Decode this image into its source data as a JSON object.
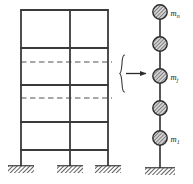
{
  "figure": {
    "width": 193,
    "height": 184,
    "background_color": "#ffffff",
    "line_color": "#3a3a3a",
    "dashed_line_color": "#8c8c8c",
    "mass_fill_color": "#b9b9b9",
    "mass_stroke_color": "#2b2b2b",
    "hatch_color": "#2b2b2b"
  },
  "frame": {
    "name": "multistory-building-frame",
    "bays": 2,
    "columns": [
      {
        "id": "column-left",
        "x": 21
      },
      {
        "id": "column-middle",
        "x": 70
      },
      {
        "id": "column-right",
        "x": 108
      }
    ],
    "column_top_y": 10,
    "column_base_y": 166,
    "beams_solid": [
      {
        "id": "beam-roof",
        "y": 10,
        "x1": 21,
        "x2": 108
      },
      {
        "id": "beam-level-5",
        "y": 48,
        "x1": 21,
        "x2": 108
      },
      {
        "id": "beam-level-4",
        "y": 85,
        "x1": 21,
        "x2": 108
      },
      {
        "id": "beam-level-3",
        "y": 122,
        "x1": 21,
        "x2": 108
      },
      {
        "id": "beam-level-2",
        "y": 150,
        "x1": 21,
        "x2": 108
      }
    ],
    "beams_dashed": [
      {
        "id": "beam-dashed-upper",
        "y": 62,
        "x1": 21,
        "x2": 112
      },
      {
        "id": "beam-dashed-lower",
        "y": 98,
        "x1": 21,
        "x2": 112
      }
    ],
    "supports": [
      {
        "id": "support-left",
        "cx": 21,
        "y": 166,
        "width": 26,
        "height": 7
      },
      {
        "id": "support-middle",
        "cx": 70,
        "y": 166,
        "width": 26,
        "height": 7
      },
      {
        "id": "support-right",
        "cx": 108,
        "y": 166,
        "width": 26,
        "height": 7
      }
    ]
  },
  "connector": {
    "name": "idealization-connector",
    "brace": {
      "x": 121,
      "y_top": 55,
      "y_bottom": 92,
      "tip_y": 73.5
    },
    "arrow": {
      "x1": 125,
      "x2": 148,
      "y": 73.5
    }
  },
  "stick_model": {
    "name": "lumped-mass-stick-model",
    "axis_x": 160,
    "axis_top_y": 12,
    "axis_base_y": 168,
    "mass_radius": 7.2,
    "masses": [
      {
        "id": "mass-n",
        "cy": 12,
        "label": "m",
        "subscript": "n",
        "has_label": true
      },
      {
        "id": "mass-n-1",
        "cy": 44,
        "label": "",
        "subscript": "",
        "has_label": false
      },
      {
        "id": "mass-j",
        "cy": 76,
        "label": "m",
        "subscript": "j",
        "has_label": true
      },
      {
        "id": "mass-2",
        "cy": 108,
        "label": "",
        "subscript": "",
        "has_label": false
      },
      {
        "id": "mass-1",
        "cy": 138,
        "label": "m",
        "subscript": "1",
        "has_label": true
      }
    ],
    "support": {
      "id": "support-stick-base",
      "cx": 160,
      "y": 168,
      "width": 30,
      "height": 7
    }
  },
  "labels": {
    "mass_top": "m",
    "mass_top_sub": "n",
    "mass_middle": "m",
    "mass_middle_sub": "j",
    "mass_bottom": "m",
    "mass_bottom_sub": "1"
  }
}
